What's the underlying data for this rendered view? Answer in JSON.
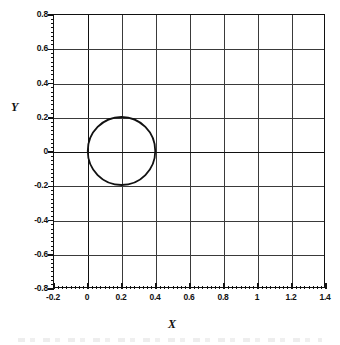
{
  "figure": {
    "background_color": "#ffffff",
    "line_color": "#111111",
    "grid_color": "#3a3a3a"
  },
  "chart_data": {
    "type": "line",
    "title": "",
    "subtitle": "",
    "xlabel": "X",
    "ylabel": "Y",
    "xlim": [
      -0.2,
      1.4
    ],
    "ylim": [
      -0.8,
      0.8
    ],
    "grid": true,
    "legend": "none",
    "xticks": [
      -0.2,
      0,
      0.2,
      0.4,
      0.6,
      0.8,
      1,
      1.2,
      1.4
    ],
    "xticklabels": [
      "-0.2",
      "0",
      "0.2",
      "0.4",
      "0.6",
      "0.8",
      "1",
      "1.2",
      "1.4"
    ],
    "yticks": [
      0.8,
      0.6,
      0.4,
      0.2,
      0,
      -0.2,
      -0.4,
      -0.6,
      -0.8
    ],
    "yticklabels": [
      "0.8",
      "0.6",
      "0.4",
      "0.2",
      "0",
      "-0.2",
      "-0.4",
      "-0.6",
      "-0.8"
    ],
    "minor_tick_step": 0.025,
    "aspect": "equal",
    "series": [
      {
        "name": "circle",
        "shape": "circle",
        "center_x": 0.2,
        "center_y": 0.0,
        "radius": 0.2,
        "x_extent": [
          0.0,
          0.4
        ],
        "y_extent": [
          -0.2,
          0.2
        ],
        "stroke": "#111111",
        "stroke_width": 1.8,
        "fill": "none"
      }
    ],
    "annotations": []
  }
}
